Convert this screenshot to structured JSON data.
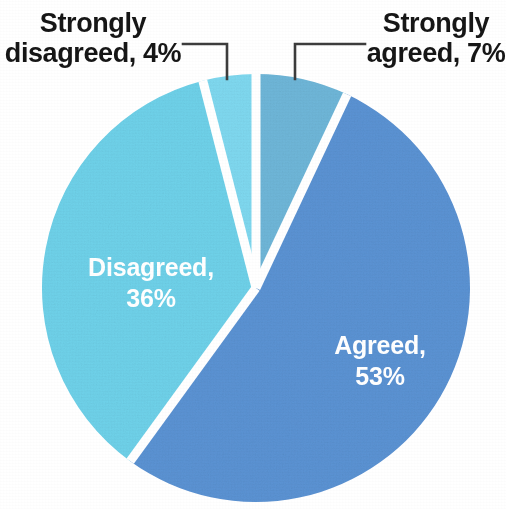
{
  "chart_data": {
    "type": "pie",
    "title": "",
    "subtitle": "",
    "xlabel": "",
    "ylabel": "",
    "legend_position": "none",
    "grid": false,
    "label_unit": "%",
    "categories": [
      "Strongly agreed",
      "Agreed",
      "Disagreed",
      "Strongly disagreed"
    ],
    "values": [
      7,
      53,
      36,
      4
    ],
    "slices": [
      {
        "name": "Strongly agreed",
        "value": 7,
        "label": "Strongly agreed, 7%",
        "label_line1": "Strongly",
        "label_line2": "agreed, 7%",
        "label_placement": "outside",
        "label_color": "#161616",
        "color": "#6fb7d9",
        "start_angle_deg": 0,
        "end_angle_deg": 25.2
      },
      {
        "name": "Agreed",
        "value": 53,
        "label": "Agreed, 53%",
        "label_line1": "Agreed,",
        "label_line2": "53%",
        "label_placement": "inside",
        "label_color": "#ffffff",
        "color": "#5b93d4",
        "start_angle_deg": 25.2,
        "end_angle_deg": 216.0
      },
      {
        "name": "Disagreed",
        "value": 36,
        "label": "Disagreed, 36%",
        "label_line1": "Disagreed,",
        "label_line2": "36%",
        "label_placement": "inside",
        "label_color": "#ffffff",
        "color": "#6fd2ea",
        "start_angle_deg": 216.0,
        "end_angle_deg": 345.6
      },
      {
        "name": "Strongly disagreed",
        "value": 4,
        "label": "Strongly disagreed, 4%",
        "label_line1": "Strongly",
        "label_line2": "disagreed, 4%",
        "label_placement": "outside",
        "label_color": "#161616",
        "color": "#7fd9f0",
        "start_angle_deg": 345.6,
        "end_angle_deg": 360.0
      }
    ],
    "colors": {
      "strongly_agreed": "#6fb7d9",
      "agreed": "#5b93d4",
      "disagreed": "#6fd2ea",
      "strongly_disagreed": "#7fd9f0",
      "background": "#ffffff",
      "leader_line": "#3c3c3c",
      "outside_label_text": "#161616",
      "inside_label_text": "#ffffff"
    }
  },
  "callouts": {
    "strongly_disagreed": {
      "line1": "Strongly",
      "line2": "disagreed, 4%"
    },
    "strongly_agreed": {
      "line1": "Strongly",
      "line2": "agreed, 7%"
    }
  },
  "inside_labels": {
    "disagreed": {
      "line1": "Disagreed,",
      "line2": "36%"
    },
    "agreed": {
      "line1": "Agreed,",
      "line2": "53%"
    }
  }
}
